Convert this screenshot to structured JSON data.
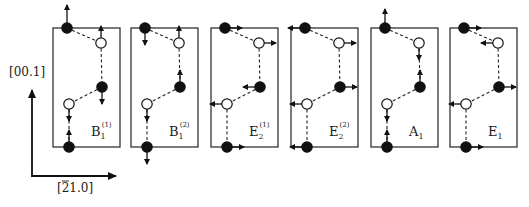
{
  "axes": {
    "vertical_label": "[00.1]",
    "horizontal_label": "[¯21.0]",
    "horizontal_label_parts": {
      "bar_digit": "2",
      "rest": "1.0]",
      "open": "["
    }
  },
  "panels": [
    {
      "id": "B1-1",
      "label_main": "B",
      "label_sub": "1",
      "label_sup": "(1)",
      "x": 53,
      "arrows": [
        [
          "up",
          18
        ],
        [
          "up",
          12
        ],
        [
          "down",
          12
        ],
        [
          "down",
          12
        ],
        [
          "up",
          12
        ]
      ]
    },
    {
      "id": "B1-2",
      "label_main": "B",
      "label_sub": "1",
      "label_sup": "(2)",
      "x": 131,
      "arrows": [
        [
          "down",
          12
        ],
        [
          "up",
          12
        ],
        [
          "up",
          12
        ],
        [
          "down",
          12
        ],
        [
          "down",
          12
        ]
      ]
    },
    {
      "id": "E2-1",
      "label_main": "E",
      "label_sub": "2",
      "label_sup": "(1)",
      "x": 211,
      "arrows": [
        [
          "right",
          12
        ],
        [
          "right",
          12
        ],
        [
          "left",
          12
        ],
        [
          "left",
          12
        ],
        [
          "right",
          12
        ]
      ]
    },
    {
      "id": "E2-2",
      "label_main": "E",
      "label_sub": "2",
      "label_sup": "(2)",
      "x": 291,
      "arrows": [
        [
          "left",
          12
        ],
        [
          "right",
          12
        ],
        [
          "right",
          12
        ],
        [
          "left",
          12
        ],
        [
          "left",
          12
        ]
      ]
    },
    {
      "id": "A1",
      "label_main": "A",
      "label_sub": "1",
      "label_sup": "",
      "x": 371,
      "arrows": [
        [
          "up",
          14
        ],
        [
          "down",
          12
        ],
        [
          "up",
          12
        ],
        [
          "down",
          12
        ],
        [
          "up",
          12
        ]
      ]
    },
    {
      "id": "E1",
      "label_main": "E",
      "label_sub": "1",
      "label_sup": "",
      "x": 450,
      "arrows": [
        [
          "right",
          12
        ],
        [
          "left",
          12
        ],
        [
          "right",
          12
        ],
        [
          "left",
          12
        ],
        [
          "right",
          12
        ]
      ]
    }
  ],
  "legend_note": "filled circles and open circles denote the two atom types; arrows show displacement directions"
}
